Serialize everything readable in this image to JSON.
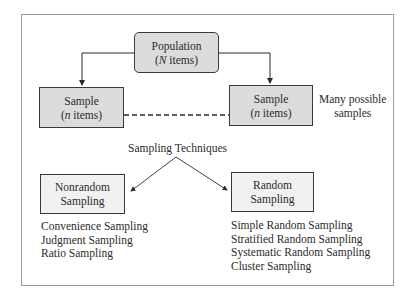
{
  "diagram": {
    "population": {
      "line1": "Population",
      "line2_var": "N",
      "line2_rest": " items)",
      "line2_open": "("
    },
    "sample_left": {
      "line1": "Sample",
      "line2_open": "(",
      "line2_var": "n",
      "line2_rest": " items)"
    },
    "sample_right": {
      "line1": "Sample",
      "line2_open": "(",
      "line2_var": "n",
      "line2_rest": " items)"
    },
    "many_samples_note": {
      "line1": "Many possible",
      "line2": "samples"
    },
    "techniques_label": "Sampling Techniques",
    "nonrandom": {
      "title_line1": "Nonrandom",
      "title_line2": "Sampling",
      "methods": [
        "Convenience Sampling",
        "Judgment Sampling",
        "Ratio Sampling"
      ]
    },
    "random": {
      "title_line1": "Random",
      "title_line2": "Sampling",
      "methods": [
        "Simple Random Sampling",
        "Stratified Random Sampling",
        "Systematic Random Sampling",
        "Cluster Sampling"
      ]
    },
    "colors": {
      "box_fill": "#dcdcdc",
      "box_fill_light": "#f1f1f1",
      "border": "#3a3a3a",
      "frame": "#9a9a9a"
    }
  }
}
